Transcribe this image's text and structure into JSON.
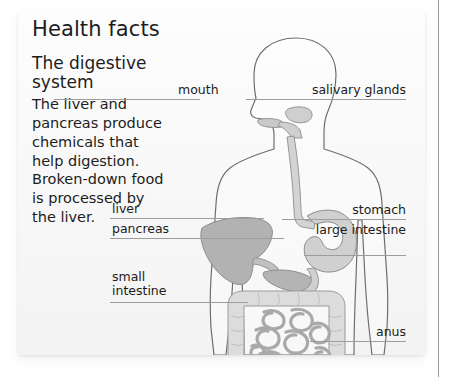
{
  "card": {
    "title": "Health facts",
    "section_title": "The digestive system",
    "body_text": "The liver and pancreas produce chemicals that help digestion. Broken-down food is processed by the liver."
  },
  "diagram": {
    "name": "human-digestive-system",
    "view": "side-profile-torso",
    "labels": [
      {
        "id": "mouth",
        "text": "mouth",
        "side": "left"
      },
      {
        "id": "salivary-glands",
        "text": "salivary glands",
        "side": "right"
      },
      {
        "id": "liver",
        "text": "liver",
        "side": "left"
      },
      {
        "id": "pancreas",
        "text": "pancreas",
        "side": "left"
      },
      {
        "id": "small-intestine",
        "text": "small intestine",
        "side": "left"
      },
      {
        "id": "stomach",
        "text": "stomach",
        "side": "right"
      },
      {
        "id": "large-intestine",
        "text": "large intestine",
        "side": "right"
      },
      {
        "id": "anus",
        "text": "anus",
        "side": "right"
      }
    ],
    "organs": [
      {
        "id": "esophagus",
        "label": "esophagus"
      },
      {
        "id": "stomach",
        "label": "stomach"
      },
      {
        "id": "liver",
        "label": "liver"
      },
      {
        "id": "pancreas",
        "label": "pancreas"
      },
      {
        "id": "large-intestine",
        "label": "large intestine"
      },
      {
        "id": "small-intestine",
        "label": "small intestine"
      },
      {
        "id": "rectum",
        "label": "rectum"
      }
    ]
  },
  "colors": {
    "card_background": "#fbfbfb",
    "text": "#1d1d1d",
    "body_outline": "#6e6e6e",
    "organ_light": "#d9d9d9",
    "organ_mid": "#c4c4c4",
    "organ_dark": "#b0b0b0",
    "leader_line": "#9d9d9d",
    "gutter_line": "#9a9a9a"
  }
}
